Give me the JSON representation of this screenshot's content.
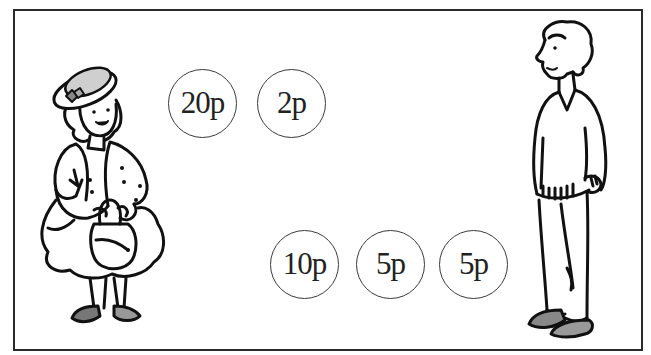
{
  "scene": {
    "description": "Illustration of a woman with a handbag and a man standing, with coins between them",
    "frame_color": "#2b2b2b",
    "line_color": "#111111"
  },
  "figures": {
    "woman": {
      "name": "woman",
      "side": "left"
    },
    "man": {
      "name": "man",
      "side": "right"
    }
  },
  "coins": [
    {
      "label": "20p",
      "value_pence": 20,
      "cx": 202,
      "cy": 103,
      "group": "top"
    },
    {
      "label": "2p",
      "value_pence": 2,
      "cx": 291,
      "cy": 103,
      "group": "top"
    },
    {
      "label": "10p",
      "value_pence": 10,
      "cx": 304,
      "cy": 264,
      "group": "bottom"
    },
    {
      "label": "5p",
      "value_pence": 5,
      "cx": 390,
      "cy": 264,
      "group": "bottom"
    },
    {
      "label": "5p",
      "value_pence": 5,
      "cx": 473,
      "cy": 264,
      "group": "bottom"
    }
  ]
}
